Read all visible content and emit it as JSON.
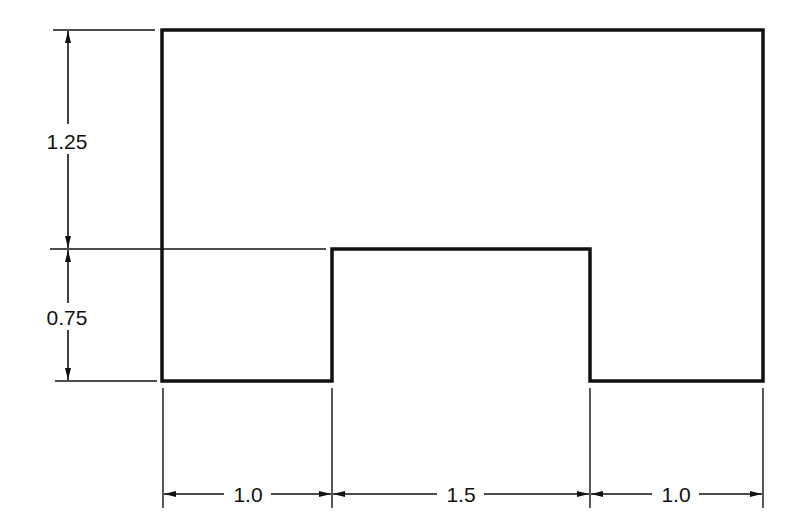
{
  "drawing": {
    "title": "",
    "colors": {
      "line": "#111111",
      "background": "#ffffff"
    },
    "shape": {
      "description": "Rectangle with a rectangular notch cut from the bottom center",
      "total_width": 3.5,
      "total_height": 2.0
    },
    "dimensions": {
      "vertical": [
        {
          "id": "upper-height",
          "label": "1.25"
        },
        {
          "id": "notch-height",
          "label": "0.75"
        }
      ],
      "horizontal": [
        {
          "id": "left-leg-width",
          "label": "1.0"
        },
        {
          "id": "notch-width",
          "label": "1.5"
        },
        {
          "id": "right-leg-width",
          "label": "1.0"
        }
      ]
    }
  }
}
